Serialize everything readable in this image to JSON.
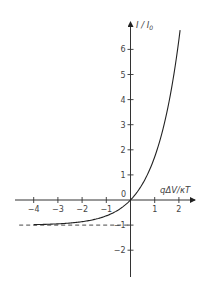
{
  "chart_data": {
    "type": "line",
    "title": "",
    "xlabel": "qΔV/κT",
    "ylabel": "I/I₀",
    "xlim": [
      -4.7,
      2.7
    ],
    "ylim": [
      -3.1,
      7.1
    ],
    "grid": false,
    "legend": null,
    "x_ticks": [
      -4,
      -3,
      -2,
      -1,
      0,
      1,
      2
    ],
    "x_tick_labels": [
      "−4",
      "−3",
      "−2",
      "−1",
      "",
      "1",
      "2"
    ],
    "y_ticks": [
      -2,
      -1,
      1,
      2,
      3,
      4,
      5,
      6
    ],
    "y_tick_labels": [
      "−2",
      "−1",
      "1",
      "2",
      "3",
      "4",
      "5",
      "6"
    ],
    "origin_label": "0",
    "series": [
      {
        "name": "I/I0 = exp(qΔV/κT) − 1",
        "style": "solid",
        "color": "#222222",
        "x": [
          -4,
          -3.5,
          -3,
          -2.5,
          -2,
          -1.5,
          -1,
          -0.5,
          0,
          0.5,
          1,
          1.5,
          2,
          2.05
        ],
        "y": [
          -0.98,
          -0.97,
          -0.95,
          -0.92,
          -0.86,
          -0.78,
          -0.63,
          -0.39,
          0,
          0.65,
          1.72,
          3.48,
          6.39,
          6.77
        ]
      },
      {
        "name": "asymptote I/I0 = −1",
        "style": "dashed",
        "color": "#222222",
        "x": [
          -4.6,
          0
        ],
        "y": [
          -1,
          -1
        ]
      }
    ]
  },
  "axes": {
    "x_label": "qΔV/κT",
    "y_label_main": "I / I",
    "y_label_sub": "0",
    "origin": "0"
  }
}
